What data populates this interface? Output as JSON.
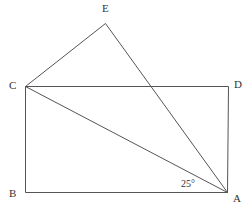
{
  "diagram": {
    "type": "geometry",
    "stroke_color": "#555555",
    "text_color": "#333333",
    "points": {
      "A": {
        "label": "A",
        "x": 227,
        "y": 192,
        "lx": 233,
        "ly": 202
      },
      "B": {
        "label": "B",
        "x": 25,
        "y": 192,
        "lx": 9,
        "ly": 197
      },
      "C": {
        "label": "C",
        "x": 25,
        "y": 86,
        "lx": 9,
        "ly": 89
      },
      "D": {
        "label": "D",
        "x": 228,
        "y": 86,
        "lx": 234,
        "ly": 88
      },
      "E": {
        "label": "E",
        "x": 105,
        "y": 23,
        "lx": 102,
        "ly": 12
      }
    },
    "segments": [
      [
        "C",
        "D"
      ],
      [
        "D",
        "A"
      ],
      [
        "A",
        "B"
      ],
      [
        "B",
        "C"
      ],
      [
        "C",
        "A"
      ],
      [
        "C",
        "E"
      ],
      [
        "E",
        "A"
      ]
    ],
    "angle_annotation": {
      "text": "25°",
      "at": "A",
      "between": [
        "B",
        "C"
      ],
      "x": 181,
      "y": 187
    }
  }
}
